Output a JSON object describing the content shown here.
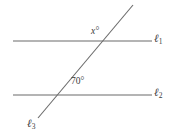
{
  "figure": {
    "name": "parallel-lines-with-transversal",
    "width": 171,
    "height": 138,
    "background_color": "#ffffff",
    "line_color": "#6a6a6a",
    "text_color": "#3a3a3a"
  },
  "labels": {
    "angle_x": "x°",
    "angle_known": "70°",
    "line1_symbol": "ℓ",
    "line1_subscript": "1",
    "line2_symbol": "ℓ",
    "line2_subscript": "2",
    "line3_symbol": "ℓ",
    "line3_subscript": "3"
  },
  "chart_data": {
    "type": "diagram",
    "title": "",
    "lines": [
      {
        "id": "l1",
        "label": "ℓ1",
        "orientation": "horizontal",
        "x1": 13,
        "y1": 41,
        "x2": 152,
        "y2": 41
      },
      {
        "id": "l2",
        "label": "ℓ2",
        "orientation": "horizontal",
        "x1": 13,
        "y1": 95,
        "x2": 152,
        "y2": 95
      },
      {
        "id": "l3",
        "label": "ℓ3",
        "orientation": "transversal",
        "x1": 133,
        "y1": 5,
        "x2": 38,
        "y2": 118
      }
    ],
    "intersections": [
      {
        "lines": [
          "l3",
          "l1"
        ],
        "x": 105,
        "y": 41
      },
      {
        "lines": [
          "l3",
          "l2"
        ],
        "x": 62,
        "y": 95
      }
    ],
    "angles": [
      {
        "label": "x°",
        "value": null,
        "unit": "degrees",
        "at_intersection": {
          "x": 105,
          "y": 41
        },
        "label_position": {
          "x": 91,
          "y": 27
        }
      },
      {
        "label": "70°",
        "value": 70,
        "unit": "degrees",
        "at_intersection": {
          "x": 62,
          "y": 95
        },
        "label_position": {
          "x": 71,
          "y": 77
        }
      }
    ]
  }
}
